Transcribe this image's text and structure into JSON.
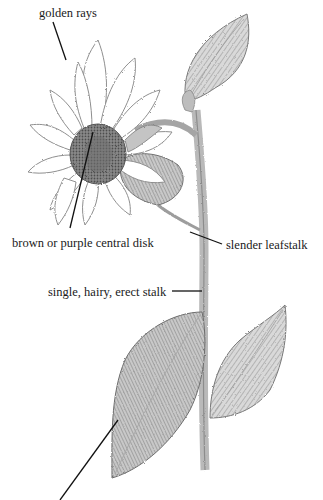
{
  "figure": {
    "style": "graphite pencil botanical illustration",
    "background": "#ffffff",
    "ink_color": "#1a1a1a"
  },
  "labels": [
    {
      "id": "golden-rays",
      "text": "golden rays"
    },
    {
      "id": "central-disk",
      "text": "brown or purple central disk"
    },
    {
      "id": "leafstalk",
      "text": "slender leafstalk"
    },
    {
      "id": "stalk",
      "text": "single, hairy, erect stalk"
    },
    {
      "id": "leaf",
      "text": ""
    }
  ]
}
